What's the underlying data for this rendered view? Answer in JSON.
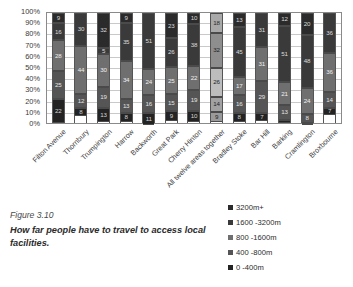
{
  "caption": {
    "figure_number": "Figure 3.10",
    "text": "How far people have to travel to access local facilities."
  },
  "chart_data": {
    "type": "bar",
    "stacked": true,
    "stack_mode": "percent",
    "title": "",
    "xlabel": "",
    "ylabel": "",
    "ylim": [
      0,
      100
    ],
    "ytick_labels": [
      "100%",
      "90%",
      "80%",
      "70%",
      "60%",
      "50%",
      "40%",
      "30%",
      "20%",
      "10%",
      "0%"
    ],
    "ytick_values": [
      100,
      90,
      80,
      70,
      60,
      50,
      40,
      30,
      20,
      10,
      0
    ],
    "grid": true,
    "legend_position": "bottom-right",
    "categories": [
      "Filton Avenue",
      "Thornbury",
      "Trumpington",
      "Harrow",
      "Backworth",
      "Great Park",
      "Cherry Hinton",
      "All twelve areas together",
      "Bradley Stoke",
      "Bar Hill",
      "Barking",
      "Cramlington",
      "Broxbourne"
    ],
    "highlight_category": "All twelve areas together",
    "series": [
      {
        "name": "3200m+",
        "values": [
          9,
          0,
          32,
          9,
          0,
          23,
          10,
          18,
          13,
          0,
          12,
          20,
          0
        ]
      },
      {
        "name": "1600 -3200m",
        "values": [
          16,
          30,
          5,
          35,
          51,
          26,
          38,
          32,
          45,
          31,
          51,
          48,
          36
        ]
      },
      {
        "name": "800 -1600m",
        "values": [
          28,
          44,
          30,
          34,
          24,
          25,
          22,
          26,
          17,
          31,
          21,
          24,
          36
        ]
      },
      {
        "name": "400 -800m",
        "values": [
          25,
          12,
          19,
          13,
          16,
          15,
          19,
          14,
          16,
          29,
          13,
          8,
          14
        ]
      },
      {
        "name": "0 -400m",
        "values": [
          22,
          8,
          13,
          8,
          11,
          9,
          10,
          9,
          8,
          7,
          3,
          1,
          7
        ]
      }
    ]
  },
  "legend": {
    "entries": [
      {
        "label": "3200m+",
        "color": "#2b2b2b"
      },
      {
        "label": "1600 -3200m",
        "color": "#3a3a3a"
      },
      {
        "label": "800 -1600m",
        "color": "#6f6f6f"
      },
      {
        "label": "400 -800m",
        "color": "#555555"
      },
      {
        "label": "0 -400m",
        "color": "#232323"
      }
    ]
  }
}
